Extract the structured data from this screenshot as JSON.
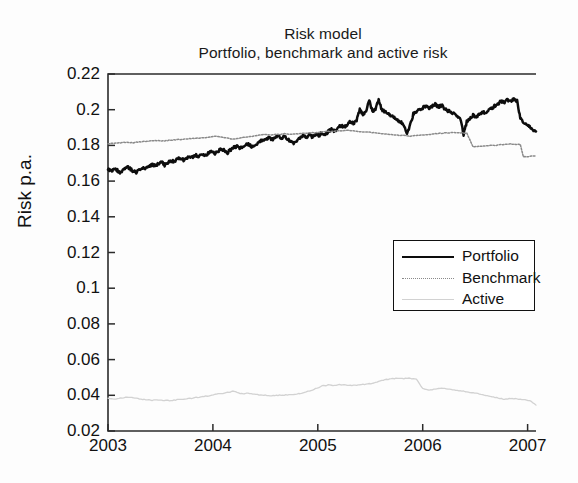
{
  "chart_data": {
    "type": "line",
    "title": "Risk model",
    "subtitle": "Portfolio, benchmark and active risk",
    "xlabel": "",
    "ylabel": "Risk p.a.",
    "xlim": [
      2003.0,
      2007.08
    ],
    "ylim": [
      0.02,
      0.22
    ],
    "ytick_labels": [
      "0.22",
      "0.2",
      "0.18",
      "0.16",
      "0.14",
      "0.12",
      "0.1",
      "0.08",
      "0.06",
      "0.04",
      "0.02"
    ],
    "ytick_values": [
      0.22,
      0.2,
      0.18,
      0.16,
      0.14,
      0.12,
      0.1,
      0.08,
      0.06,
      0.04,
      0.02
    ],
    "xtick_labels": [
      "2003",
      "2004",
      "2005",
      "2006",
      "2007"
    ],
    "xtick_values": [
      2003,
      2004,
      2005,
      2006,
      2007
    ],
    "grid": false,
    "legend_position": "center-right",
    "colors": {
      "portfolio": "#0d0d0d",
      "benchmark": "#8a8a8a",
      "active": "#d2d2d2",
      "axis": "#2b2b2b",
      "background": "#fdfdfd"
    },
    "series": [
      {
        "name": "Portfolio",
        "style": "solid-thick",
        "color": "#0d0d0d",
        "x": [
          2003.0,
          2003.03,
          2003.06,
          2003.09,
          2003.12,
          2003.15,
          2003.18,
          2003.21,
          2003.24,
          2003.27,
          2003.3,
          2003.33,
          2003.36,
          2003.39,
          2003.42,
          2003.45,
          2003.48,
          2003.51,
          2003.54,
          2003.57,
          2003.6,
          2003.63,
          2003.66,
          2003.69,
          2003.72,
          2003.75,
          2003.78,
          2003.81,
          2003.84,
          2003.87,
          2003.9,
          2003.93,
          2003.96,
          2003.99,
          2004.02,
          2004.05,
          2004.08,
          2004.11,
          2004.14,
          2004.17,
          2004.2,
          2004.23,
          2004.26,
          2004.29,
          2004.32,
          2004.35,
          2004.38,
          2004.41,
          2004.44,
          2004.47,
          2004.5,
          2004.53,
          2004.56,
          2004.59,
          2004.62,
          2004.65,
          2004.68,
          2004.71,
          2004.74,
          2004.77,
          2004.8,
          2004.83,
          2004.86,
          2004.89,
          2004.92,
          2004.95,
          2004.98,
          2005.01,
          2005.04,
          2005.07,
          2005.1,
          2005.13,
          2005.16,
          2005.19,
          2005.22,
          2005.25,
          2005.28,
          2005.31,
          2005.34,
          2005.37,
          2005.4,
          2005.43,
          2005.46,
          2005.49,
          2005.52,
          2005.55,
          2005.58,
          2005.61,
          2005.64,
          2005.67,
          2005.7,
          2005.73,
          2005.76,
          2005.79,
          2005.82,
          2005.85,
          2005.88,
          2005.91,
          2005.94,
          2005.97,
          2006.0,
          2006.03,
          2006.06,
          2006.09,
          2006.12,
          2006.15,
          2006.18,
          2006.21,
          2006.24,
          2006.27,
          2006.3,
          2006.33,
          2006.36,
          2006.39,
          2006.42,
          2006.45,
          2006.48,
          2006.51,
          2006.54,
          2006.57,
          2006.6,
          2006.63,
          2006.66,
          2006.69,
          2006.72,
          2006.75,
          2006.78,
          2006.81,
          2006.84,
          2006.87,
          2006.9,
          2006.93,
          2006.96,
          2006.99,
          2007.02,
          2007.05,
          2007.08
        ],
        "y": [
          0.1665,
          0.1655,
          0.1672,
          0.166,
          0.1648,
          0.1668,
          0.1682,
          0.167,
          0.1655,
          0.1648,
          0.1662,
          0.1675,
          0.1668,
          0.168,
          0.1692,
          0.1685,
          0.1698,
          0.1705,
          0.169,
          0.1702,
          0.1715,
          0.1708,
          0.1722,
          0.173,
          0.1718,
          0.1728,
          0.174,
          0.1732,
          0.1745,
          0.1738,
          0.175,
          0.1742,
          0.1758,
          0.1765,
          0.1752,
          0.1768,
          0.178,
          0.1772,
          0.176,
          0.1775,
          0.1788,
          0.1795,
          0.1782,
          0.1798,
          0.181,
          0.1802,
          0.179,
          0.1805,
          0.1818,
          0.1828,
          0.1835,
          0.1842,
          0.183,
          0.1845,
          0.1852,
          0.184,
          0.1848,
          0.1838,
          0.1825,
          0.1815,
          0.1828,
          0.184,
          0.1852,
          0.1845,
          0.1858,
          0.1848,
          0.1862,
          0.1855,
          0.187,
          0.1862,
          0.1878,
          0.189,
          0.1882,
          0.1898,
          0.191,
          0.1902,
          0.1918,
          0.1935,
          0.1925,
          0.1942,
          0.2,
          0.1975,
          0.1985,
          0.2055,
          0.199,
          0.2,
          0.206,
          0.1998,
          0.1988,
          0.1975,
          0.1968,
          0.1958,
          0.1945,
          0.193,
          0.1915,
          0.1862,
          0.1912,
          0.1975,
          0.1988,
          0.2,
          0.201,
          0.2022,
          0.2008,
          0.2018,
          0.203,
          0.2015,
          0.2025,
          0.2005,
          0.1995,
          0.1985,
          0.1975,
          0.1962,
          0.1948,
          0.1862,
          0.1932,
          0.1952,
          0.1968,
          0.1958,
          0.1975,
          0.1988,
          0.1978,
          0.1995,
          0.201,
          0.2022,
          0.2035,
          0.2048,
          0.2042,
          0.2055,
          0.2048,
          0.2058,
          0.205,
          0.1955,
          0.1928,
          0.1918,
          0.1905,
          0.1885,
          0.1878
        ]
      },
      {
        "name": "Benchmark",
        "style": "dotted",
        "color": "#8a8a8a",
        "x": [
          2003.0,
          2003.06,
          2003.12,
          2003.18,
          2003.24,
          2003.3,
          2003.36,
          2003.42,
          2003.48,
          2003.54,
          2003.6,
          2003.66,
          2003.72,
          2003.78,
          2003.84,
          2003.9,
          2003.96,
          2004.02,
          2004.08,
          2004.14,
          2004.2,
          2004.26,
          2004.32,
          2004.38,
          2004.44,
          2004.5,
          2004.56,
          2004.62,
          2004.68,
          2004.74,
          2004.8,
          2004.86,
          2004.92,
          2004.98,
          2005.04,
          2005.1,
          2005.16,
          2005.22,
          2005.28,
          2005.34,
          2005.4,
          2005.46,
          2005.52,
          2005.58,
          2005.64,
          2005.7,
          2005.76,
          2005.82,
          2005.88,
          2005.94,
          2006.0,
          2006.06,
          2006.12,
          2006.18,
          2006.24,
          2006.3,
          2006.36,
          2006.42,
          2006.48,
          2006.54,
          2006.6,
          2006.66,
          2006.72,
          2006.78,
          2006.84,
          2006.9,
          2006.93,
          2006.96,
          2007.02,
          2007.08
        ],
        "y": [
          0.181,
          0.1812,
          0.1815,
          0.1818,
          0.1815,
          0.182,
          0.1822,
          0.1825,
          0.1828,
          0.1825,
          0.183,
          0.1832,
          0.1835,
          0.1838,
          0.184,
          0.1842,
          0.1845,
          0.1852,
          0.1848,
          0.184,
          0.1835,
          0.1842,
          0.1848,
          0.1852,
          0.1858,
          0.1862,
          0.1858,
          0.1862,
          0.1865,
          0.1862,
          0.1865,
          0.1868,
          0.187,
          0.1872,
          0.1875,
          0.1878,
          0.188,
          0.1882,
          0.1885,
          0.1882,
          0.1878,
          0.1875,
          0.1872,
          0.1868,
          0.1865,
          0.1862,
          0.1858,
          0.1855,
          0.1852,
          0.1855,
          0.1858,
          0.1862,
          0.1865,
          0.1868,
          0.187,
          0.1872,
          0.187,
          0.1868,
          0.1792,
          0.1795,
          0.1798,
          0.18,
          0.1802,
          0.1805,
          0.1808,
          0.1806,
          0.1805,
          0.1735,
          0.1738,
          0.174
        ]
      },
      {
        "name": "Active",
        "style": "solid-thin",
        "color": "#d2d2d2",
        "x": [
          2003.0,
          2003.06,
          2003.12,
          2003.18,
          2003.24,
          2003.3,
          2003.36,
          2003.42,
          2003.48,
          2003.54,
          2003.6,
          2003.66,
          2003.72,
          2003.78,
          2003.84,
          2003.9,
          2003.96,
          2004.02,
          2004.08,
          2004.14,
          2004.2,
          2004.26,
          2004.32,
          2004.38,
          2004.44,
          2004.5,
          2004.56,
          2004.62,
          2004.68,
          2004.74,
          2004.8,
          2004.86,
          2004.92,
          2004.98,
          2005.04,
          2005.1,
          2005.16,
          2005.22,
          2005.28,
          2005.34,
          2005.4,
          2005.46,
          2005.52,
          2005.58,
          2005.64,
          2005.7,
          2005.76,
          2005.82,
          2005.88,
          2005.94,
          2006.0,
          2006.06,
          2006.12,
          2006.18,
          2006.24,
          2006.3,
          2006.36,
          2006.42,
          2006.48,
          2006.54,
          2006.6,
          2006.66,
          2006.72,
          2006.78,
          2006.84,
          2006.9,
          2006.96,
          2007.02,
          2007.08
        ],
        "y": [
          0.0382,
          0.0378,
          0.0384,
          0.039,
          0.0386,
          0.038,
          0.0376,
          0.0372,
          0.0374,
          0.037,
          0.0372,
          0.0375,
          0.0378,
          0.0382,
          0.0388,
          0.0392,
          0.0398,
          0.0404,
          0.041,
          0.0416,
          0.0424,
          0.0408,
          0.0412,
          0.0406,
          0.0402,
          0.04,
          0.0398,
          0.04,
          0.0402,
          0.0404,
          0.0408,
          0.0414,
          0.0424,
          0.0438,
          0.0452,
          0.0458,
          0.0456,
          0.046,
          0.0458,
          0.0456,
          0.0458,
          0.0462,
          0.0466,
          0.0476,
          0.0488,
          0.0492,
          0.0496,
          0.0494,
          0.0496,
          0.049,
          0.0438,
          0.043,
          0.0436,
          0.0442,
          0.0436,
          0.043,
          0.0426,
          0.042,
          0.0414,
          0.0408,
          0.04,
          0.0392,
          0.0384,
          0.0378,
          0.0382,
          0.038,
          0.0376,
          0.037,
          0.0345
        ]
      }
    ]
  },
  "legend": {
    "items": [
      {
        "label": "Portfolio",
        "swatch": "portfolio-line-swatch"
      },
      {
        "label": "Benchmark",
        "swatch": "benchmark-line-swatch"
      },
      {
        "label": "Active",
        "swatch": "active-line-swatch"
      }
    ]
  }
}
